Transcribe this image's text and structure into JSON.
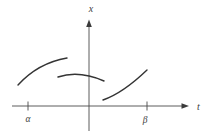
{
  "figure": {
    "colors": {
      "background": "#ffffff",
      "line": "#4a4a4a",
      "curve": "#343434",
      "text": "#3d3d3d"
    },
    "axes": {
      "vertical_label": "x",
      "horizontal_label": "t"
    },
    "ticks": {
      "alpha_label": "α",
      "beta_label": "β"
    },
    "curves": [
      {
        "name": "left-arc",
        "shape": "concave-down rising arc",
        "path": "M18,85 Q38,63 67,58"
      },
      {
        "name": "middle-arc",
        "shape": "shallow concave-down arc crossing vertical axis",
        "path": "M58,77 Q79,70 104,81"
      },
      {
        "name": "right-arc",
        "shape": "concave-up rising arc",
        "path": "M103,100 Q123,93 147,70"
      }
    ]
  }
}
